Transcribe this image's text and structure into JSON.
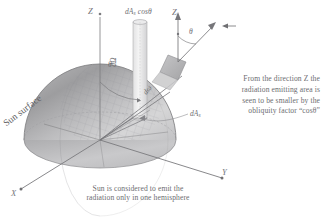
{
  "figure": {
    "background_color": "#ffffff",
    "ink_color": "#6d6d71",
    "hemisphere_fill_light": "#d8d8d8",
    "hemisphere_fill_dark": "#9a9a9c",
    "patch_fill": "#b4b4b6"
  },
  "axes": {
    "x_label": "X",
    "y_label": "Y",
    "z_label": "Z",
    "z_label_secondary": "Z"
  },
  "labels": {
    "sun_surface": "Sun surface",
    "da_cos_theta": "dA",
    "da_cos_theta_sub": "s",
    "da_cos_theta_tail": " cosθ",
    "d_omega_solid": "dΩ",
    "d_omega_small": "dω",
    "da_patch": "dA",
    "da_patch_sub": "s",
    "theta_main": "θ",
    "theta_secondary": "θ"
  },
  "annotations": {
    "explanation_line1": "From the direction Z the",
    "explanation_line2": "radiation emitting area is",
    "explanation_line3": "seen to be smaller by the",
    "explanation_line4": "obliquity factor “cosθ”",
    "caption_line1": "Sun is considered to emit the",
    "caption_line2": "radiation only in one hemisphere"
  },
  "icons": {
    "viewer_arrow": "observer-direction-arrow",
    "z_axis_arrow": "axis-arrow-up",
    "ray_arrow": "radiation-ray-arrow"
  }
}
